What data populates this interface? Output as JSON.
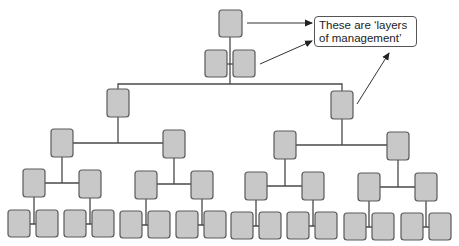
{
  "diagram": {
    "callout": {
      "text": "These are ‘layers of management’"
    },
    "node_fill": "#c8c8c8",
    "node_stroke": "#5a5a5a",
    "line_color": "#4a4a4a",
    "levels": 6,
    "nodes": [
      {
        "id": "top",
        "x": 219,
        "y": 10,
        "w": 23,
        "h": 27
      },
      {
        "id": "l2a",
        "x": 205,
        "y": 50,
        "w": 22,
        "h": 27
      },
      {
        "id": "l2b",
        "x": 233,
        "y": 50,
        "w": 22,
        "h": 27
      },
      {
        "id": "l3a",
        "x": 107,
        "y": 89,
        "w": 22,
        "h": 28
      },
      {
        "id": "l3b",
        "x": 331,
        "y": 91,
        "w": 22,
        "h": 28
      },
      {
        "id": "l4a",
        "x": 51,
        "y": 129,
        "w": 22,
        "h": 28
      },
      {
        "id": "l4b",
        "x": 163,
        "y": 130,
        "w": 22,
        "h": 28
      },
      {
        "id": "l4c",
        "x": 274,
        "y": 131,
        "w": 22,
        "h": 28
      },
      {
        "id": "l4d",
        "x": 387,
        "y": 132,
        "w": 22,
        "h": 28
      },
      {
        "id": "l5a",
        "x": 23,
        "y": 169,
        "w": 22,
        "h": 28
      },
      {
        "id": "l5b",
        "x": 79,
        "y": 170,
        "w": 22,
        "h": 28
      },
      {
        "id": "l5c",
        "x": 135,
        "y": 171,
        "w": 22,
        "h": 28
      },
      {
        "id": "l5d",
        "x": 191,
        "y": 171,
        "w": 22,
        "h": 28
      },
      {
        "id": "l5e",
        "x": 245,
        "y": 172,
        "w": 22,
        "h": 28
      },
      {
        "id": "l5f",
        "x": 302,
        "y": 172,
        "w": 22,
        "h": 28
      },
      {
        "id": "l5g",
        "x": 358,
        "y": 173,
        "w": 22,
        "h": 28
      },
      {
        "id": "l5h",
        "x": 415,
        "y": 173,
        "w": 22,
        "h": 28
      },
      {
        "id": "l6a",
        "x": 8,
        "y": 210,
        "w": 22,
        "h": 27
      },
      {
        "id": "l6b",
        "x": 36,
        "y": 210,
        "w": 22,
        "h": 27
      },
      {
        "id": "l6c",
        "x": 64,
        "y": 210,
        "w": 22,
        "h": 27
      },
      {
        "id": "l6d",
        "x": 92,
        "y": 210,
        "w": 22,
        "h": 27
      },
      {
        "id": "l6e",
        "x": 120,
        "y": 211,
        "w": 22,
        "h": 27
      },
      {
        "id": "l6f",
        "x": 148,
        "y": 211,
        "w": 22,
        "h": 27
      },
      {
        "id": "l6g",
        "x": 176,
        "y": 211,
        "w": 22,
        "h": 27
      },
      {
        "id": "l6h",
        "x": 204,
        "y": 211,
        "w": 22,
        "h": 27
      },
      {
        "id": "l6i",
        "x": 231,
        "y": 212,
        "w": 22,
        "h": 27
      },
      {
        "id": "l6j",
        "x": 259,
        "y": 212,
        "w": 22,
        "h": 27
      },
      {
        "id": "l6k",
        "x": 287,
        "y": 212,
        "w": 22,
        "h": 27
      },
      {
        "id": "l6l",
        "x": 315,
        "y": 212,
        "w": 22,
        "h": 27
      },
      {
        "id": "l6m",
        "x": 344,
        "y": 213,
        "w": 22,
        "h": 27
      },
      {
        "id": "l6n",
        "x": 372,
        "y": 213,
        "w": 22,
        "h": 27
      },
      {
        "id": "l6o",
        "x": 401,
        "y": 213,
        "w": 22,
        "h": 27
      },
      {
        "id": "l6p",
        "x": 429,
        "y": 213,
        "w": 22,
        "h": 27
      }
    ]
  }
}
